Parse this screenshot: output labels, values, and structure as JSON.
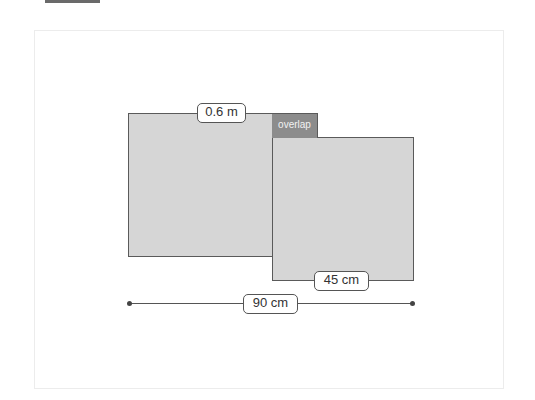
{
  "diagram": {
    "type": "overlapping-rectangles",
    "shapes": [
      {
        "id": "rect-a",
        "dimension_label": "0.6 m",
        "fill": "#d6d6d6",
        "stroke": "#5a5a5a"
      },
      {
        "id": "rect-b",
        "dimension_label": "45 cm",
        "fill": "#d6d6d6",
        "stroke": "#5a5a5a"
      }
    ],
    "overlap": {
      "label": "overlap",
      "fill": "#8c8c8c"
    },
    "total_dimension": {
      "label": "90 cm",
      "orientation": "horizontal"
    }
  },
  "labels": {
    "rect_a_width": "0.6 m",
    "rect_b_width": "45 cm",
    "overlap": "overlap",
    "total_width": "90 cm"
  },
  "colors": {
    "shape_fill": "#d6d6d6",
    "overlap_fill": "#8c8c8c",
    "stroke": "#5a5a5a",
    "background": "#ffffff"
  }
}
